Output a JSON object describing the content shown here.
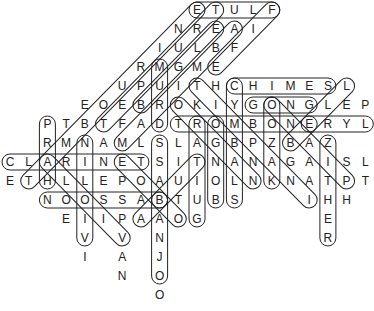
{
  "puzzle": {
    "title": "Musical Instruments Word Search (solved)",
    "grid": {
      "col_origin_x": 10,
      "col_spacing": 18.7,
      "row_origin_y": 10,
      "row_spacing": 19
    },
    "rows": [
      {
        "start": 10,
        "letters": "ETULF"
      },
      {
        "start": 9,
        "letters": "NREAI"
      },
      {
        "start": 8,
        "letters": "IULBF"
      },
      {
        "start": 7,
        "letters": "RMGME"
      },
      {
        "start": 6,
        "letters": "UPUITHCHIMESL"
      },
      {
        "start": 4,
        "letters": "EOEBROKIYGONGLEP"
      },
      {
        "start": 2,
        "letters": "PTBTFADTROMBONERYL"
      },
      {
        "start": 2,
        "letters": "RMNAMLSLAGBPZBAZ"
      },
      {
        "start": 0,
        "letters": "CLARINETSITNANAGAISL"
      },
      {
        "start": 0,
        "letters": "ETHLLEPOAUIOLNKNATPT"
      },
      {
        "cells": [
          [
            2,
            "N"
          ],
          [
            3,
            "O"
          ],
          [
            4,
            "O"
          ],
          [
            5,
            "S"
          ],
          [
            6,
            "S"
          ],
          [
            7,
            "A"
          ],
          [
            8,
            "B"
          ],
          [
            9,
            "T"
          ],
          [
            10,
            "U"
          ],
          [
            11,
            "B"
          ],
          [
            12,
            "S"
          ],
          [
            16,
            "I"
          ],
          [
            17,
            "H"
          ],
          [
            18,
            "H"
          ]
        ]
      },
      {
        "cells": [
          [
            3,
            "E"
          ],
          [
            4,
            "I"
          ],
          [
            5,
            "I"
          ],
          [
            6,
            "P"
          ],
          [
            7,
            "A"
          ],
          [
            8,
            "A"
          ],
          [
            9,
            "O"
          ],
          [
            10,
            "G"
          ],
          [
            17,
            "E"
          ]
        ]
      },
      {
        "cells": [
          [
            4,
            "V"
          ],
          [
            6,
            "V"
          ],
          [
            8,
            "N"
          ],
          [
            17,
            "R"
          ]
        ]
      },
      {
        "cells": [
          [
            4,
            "I"
          ],
          [
            6,
            "A"
          ],
          [
            8,
            "J"
          ]
        ]
      },
      {
        "cells": [
          [
            6,
            "N"
          ],
          [
            8,
            "O"
          ]
        ]
      },
      {
        "cells": [
          [
            8,
            "O"
          ]
        ]
      }
    ],
    "found_words": [
      {
        "word": "FLUTE",
        "from": [
          0,
          14
        ],
        "to": [
          0,
          10
        ]
      },
      {
        "word": "TAMBOURINE",
        "from": [
          9,
          1
        ],
        "to": [
          0,
          10
        ]
      },
      {
        "word": "TRUMPET",
        "from": [
          0,
          11
        ],
        "to": [
          6,
          5
        ]
      },
      {
        "word": "FIFE",
        "from": [
          0,
          14
        ],
        "to": [
          3,
          11
        ]
      },
      {
        "word": "MARIMBA",
        "from": [
          7,
          6
        ],
        "to": [
          1,
          12
        ]
      },
      {
        "word": "BUGLE",
        "from": [
          5,
          7
        ],
        "to": [
          1,
          11
        ]
      },
      {
        "word": "DRUM",
        "from": [
          6,
          8
        ],
        "to": [
          3,
          8
        ]
      },
      {
        "word": "BASS",
        "from": [
          10,
          8
        ],
        "to": [
          7,
          8
        ]
      },
      {
        "word": "BANJO",
        "from": [
          10,
          8
        ],
        "to": [
          14,
          8
        ]
      },
      {
        "word": "CHIMES",
        "from": [
          4,
          12
        ],
        "to": [
          4,
          17
        ]
      },
      {
        "word": "BELL",
        "from": [
          7,
          15
        ],
        "to": [
          4,
          18
        ]
      },
      {
        "word": "GONG",
        "from": [
          5,
          13
        ],
        "to": [
          5,
          16
        ]
      },
      {
        "word": "TROMBONE",
        "from": [
          6,
          9
        ],
        "to": [
          6,
          16
        ]
      },
      {
        "word": "LYRE",
        "from": [
          6,
          19
        ],
        "to": [
          6,
          16
        ]
      },
      {
        "word": "TIMPANI",
        "from": [
          4,
          10
        ],
        "to": [
          10,
          16
        ]
      },
      {
        "word": "ORGAN",
        "from": [
          5,
          9
        ],
        "to": [
          9,
          13
        ]
      },
      {
        "word": "PIANO",
        "from": [
          9,
          18
        ],
        "to": [
          5,
          14
        ]
      },
      {
        "word": "KAZOO",
        "from": [
          9,
          14
        ],
        "to": [
          5,
          14
        ]
      },
      {
        "word": "ZITHER",
        "from": [
          7,
          17
        ],
        "to": [
          12,
          17
        ]
      },
      {
        "word": "CYMBALS",
        "from": [
          4,
          12
        ],
        "to": [
          10,
          12
        ]
      },
      {
        "word": "BONGO",
        "from": [
          10,
          11
        ],
        "to": [
          6,
          11
        ]
      },
      {
        "word": "GUITAR",
        "from": [
          11,
          10
        ],
        "to": [
          6,
          10
        ]
      },
      {
        "word": "TUBA",
        "from": [
          8,
          10
        ],
        "to": [
          11,
          7
        ]
      },
      {
        "word": "OBOE",
        "from": [
          11,
          9
        ],
        "to": [
          8,
          6
        ]
      },
      {
        "word": "CLARINET",
        "from": [
          8,
          0
        ],
        "to": [
          8,
          7
        ]
      },
      {
        "word": "HARP",
        "from": [
          9,
          2
        ],
        "to": [
          6,
          2
        ]
      },
      {
        "word": "VIOLIN",
        "from": [
          12,
          4
        ],
        "to": [
          7,
          4
        ]
      },
      {
        "word": "VIOLA",
        "from": [
          12,
          6
        ],
        "to": [
          8,
          2
        ]
      },
      {
        "word": "BASSOON",
        "from": [
          10,
          8
        ],
        "to": [
          10,
          2
        ]
      }
    ],
    "colors": {
      "letter": "#222222",
      "capsule": "#222222",
      "background": "#ffffff"
    }
  }
}
